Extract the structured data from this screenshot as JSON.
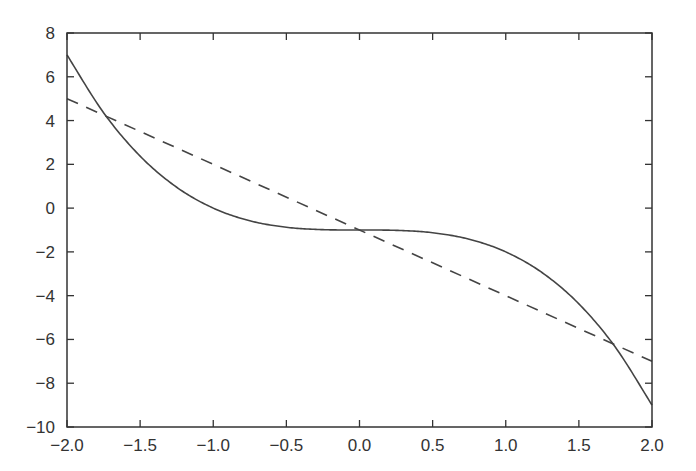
{
  "chart_data": {
    "type": "line",
    "title": "",
    "xlabel": "",
    "ylabel": "",
    "xlim": [
      -2.0,
      2.0
    ],
    "ylim": [
      -10,
      8
    ],
    "grid": false,
    "legend": null,
    "x_ticks": [
      -2.0,
      -1.5,
      -1.0,
      -0.5,
      0.0,
      0.5,
      1.0,
      1.5,
      2.0
    ],
    "x_tick_labels": [
      "−2.0",
      "−1.5",
      "−1.0",
      "−0.5",
      "0.0",
      "0.5",
      "1.0",
      "1.5",
      "2.0"
    ],
    "y_ticks": [
      8,
      6,
      4,
      2,
      0,
      -2,
      -4,
      -6,
      -8,
      -10
    ],
    "y_tick_labels": [
      "8",
      "6",
      "4",
      "2",
      "0",
      "−2",
      "−4",
      "−6",
      "−8",
      "−10"
    ],
    "series": [
      {
        "name": "cubic",
        "style": "solid",
        "color": "#444444",
        "formula": "y = -x^3 - 1",
        "x": [
          -2.0,
          -1.75,
          -1.5,
          -1.25,
          -1.0,
          -0.75,
          -0.5,
          -0.25,
          0.0,
          0.25,
          0.5,
          0.75,
          1.0,
          1.25,
          1.5,
          1.75,
          2.0
        ],
        "values": [
          7.0,
          4.36,
          2.375,
          0.953,
          0.0,
          -0.578,
          -0.875,
          -0.984,
          -1.0,
          -1.016,
          -1.125,
          -1.422,
          -2.0,
          -2.953,
          -4.375,
          -6.359,
          -9.0
        ]
      },
      {
        "name": "line",
        "style": "dashed",
        "color": "#444444",
        "formula": "y = -3x - 1",
        "x": [
          -2.0,
          2.0
        ],
        "values": [
          5.0,
          -7.0
        ]
      }
    ]
  },
  "plot": {
    "frame_color": "#333333",
    "background": "#ffffff"
  }
}
